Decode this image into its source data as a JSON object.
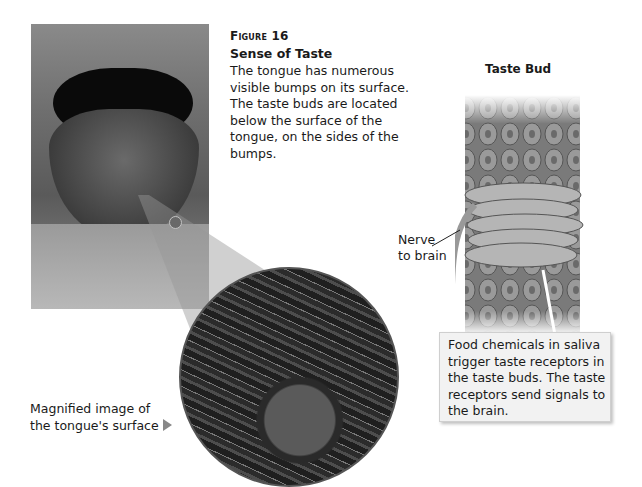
{
  "figure": {
    "label": "Figure 16",
    "title": "Sense of Taste",
    "caption": "The tongue has numerous visible bumps on its surface. The taste buds are located below the surface of the tongue, on the sides of the bumps."
  },
  "diagram": {
    "title": "Taste Bud",
    "nerve_label_line1": "Nerve",
    "nerve_label_line2": "to brain",
    "callout": "Food chemicals in saliva trigger taste receptors in the taste buds. The taste receptors send signals to the brain."
  },
  "photos": {
    "tongue_alt": "Photo of an open mouth with tongue extended",
    "magnified_label_line1": "Magnified image of",
    "magnified_label_line2": "the tongue's surface",
    "arrow_icon": "right-triangle-icon"
  },
  "colors": {
    "text": "#1a1a1a",
    "callout_bg": "#f2f2f2",
    "arrow": "#888888"
  }
}
